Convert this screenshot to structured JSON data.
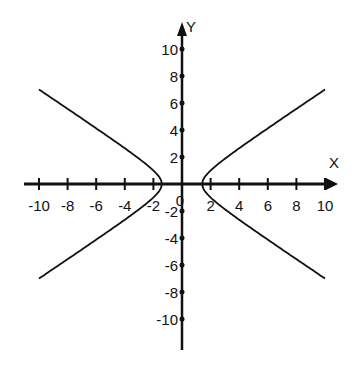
{
  "chart_data": {
    "type": "line",
    "title": "",
    "xlabel": "X",
    "ylabel": "Y",
    "xlim": [
      -10,
      10
    ],
    "ylim": [
      -10,
      10
    ],
    "grid": false,
    "legend": null,
    "x_ticks": [
      -10,
      -8,
      -6,
      -4,
      -2,
      2,
      4,
      6,
      8,
      10
    ],
    "y_ticks": [
      10,
      8,
      6,
      4,
      2,
      -2,
      -4,
      -6,
      -8,
      -10
    ],
    "origin_label": "0",
    "equation": "x^2/2 - y^2 = 1",
    "series": [
      {
        "name": "right-branch",
        "x": [
          10,
          8,
          6,
          4,
          3,
          2,
          1.6,
          1.45,
          1.414,
          1.45,
          1.6,
          2,
          3,
          4,
          6,
          8,
          10
        ],
        "y": [
          7.0,
          5.57,
          4.12,
          2.65,
          1.87,
          1.0,
          0.53,
          0.23,
          0,
          -0.23,
          -0.53,
          -1.0,
          -1.87,
          -2.65,
          -4.12,
          -5.57,
          -7.0
        ]
      },
      {
        "name": "left-branch",
        "x": [
          -10,
          -8,
          -6,
          -4,
          -3,
          -2,
          -1.6,
          -1.45,
          -1.414,
          -1.45,
          -1.6,
          -2,
          -3,
          -4,
          -6,
          -8,
          -10
        ],
        "y": [
          7.0,
          5.57,
          4.12,
          2.65,
          1.87,
          1.0,
          0.53,
          0.23,
          0,
          -0.23,
          -0.53,
          -1.0,
          -1.87,
          -2.65,
          -4.12,
          -5.57,
          -7.0
        ]
      }
    ]
  },
  "colors": {
    "axis": "#111111",
    "curve": "#111111",
    "background": "#ffffff"
  }
}
